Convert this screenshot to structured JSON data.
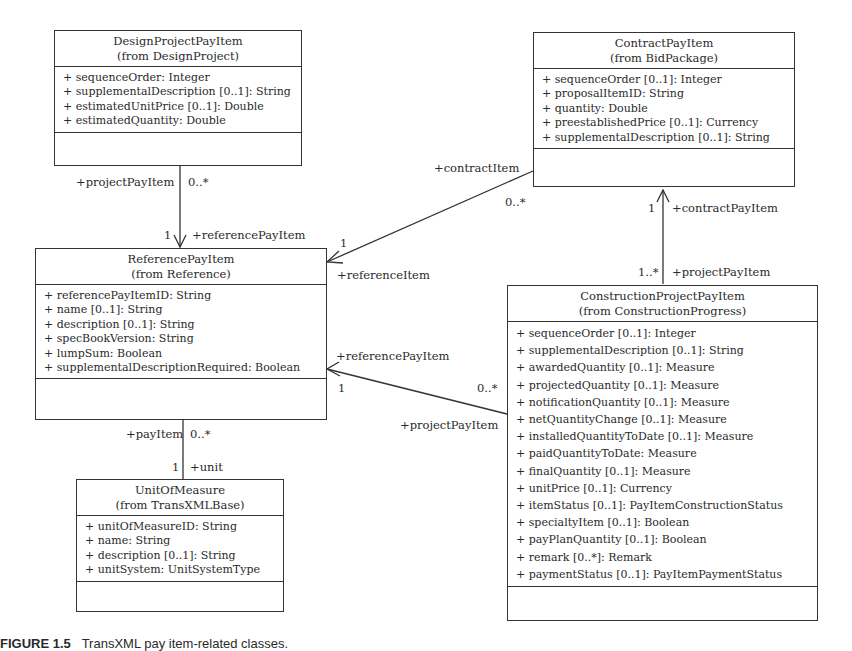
{
  "classes": {
    "design": {
      "name": "DesignProjectPayItem",
      "package": "(from DesignProject)",
      "attributes": [
        "+ sequenceOrder: Integer",
        "+ supplementalDescription [0..1]: String",
        "+ estimatedUnitPrice [0..1]: Double",
        "+ estimatedQuantity: Double"
      ]
    },
    "contract": {
      "name": "ContractPayItem",
      "package": "(from BidPackage)",
      "attributes": [
        "+ sequenceOrder [0..1]: Integer",
        "+ proposalItemID: String",
        "+ quantity: Double",
        "+ preestablishedPrice [0..1]: Currency",
        "+ supplementalDescription [0..1]: String"
      ]
    },
    "reference": {
      "name": "ReferencePayItem",
      "package": "(from Reference)",
      "attributes": [
        "+ referencePayItemID: String",
        "+ name [0..1]: String",
        "+ description [0..1]: String",
        "+ specBookVersion: String",
        "+ lumpSum: Boolean",
        "+ supplementalDescriptionRequired: Boolean"
      ]
    },
    "construction": {
      "name": "ConstructionProjectPayItem",
      "package": "(from ConstructionProgress)",
      "attributes": [
        "+ sequenceOrder [0..1]: Integer",
        "+ supplementalDescription [0..1]: String",
        "+ awardedQuantity [0..1]: Measure",
        "+ projectedQuantity [0..1]: Measure",
        "+ notificationQuantity [0..1]: Measure",
        "+ netQuantityChange [0..1]: Measure",
        "+ installedQuantityToDate [0..1]: Measure",
        "+ paidQuantityToDate: Measure",
        "+ finalQuantity [0..1]: Measure",
        "+ unitPrice [0..1]: Currency",
        "+ itemStatus [0..1]: PayItemConstructionStatus",
        "+ specialtyItem [0..1]: Boolean",
        "+ payPlanQuantity [0..1]: Boolean",
        "+ remark [0..*]: Remark",
        "+ paymentStatus [0..1]: PayItemPaymentStatus"
      ]
    },
    "unit": {
      "name": "UnitOfMeasure",
      "package": "(from TransXMLBase)",
      "attributes": [
        "+ unitOfMeasureID: String",
        "+ name: String",
        "+ description [0..1]: String",
        "+ unitSystem: UnitSystemType"
      ]
    }
  },
  "associations": {
    "design_ref": {
      "source_role": "+projectPayItem",
      "source_mult": "0..*",
      "target_mult": "1",
      "target_role": "+referencePayItem"
    },
    "contract_ref": {
      "source_role": "+contractItem",
      "source_mult": "0..*",
      "target_mult": "1",
      "target_role": "+referenceItem"
    },
    "construction_contract": {
      "target_mult": "1",
      "target_role": "+contractPayItem",
      "source_mult": "1..*",
      "source_role": "+projectPayItem"
    },
    "construction_ref": {
      "target_role": "+referencePayItem",
      "target_mult": "1",
      "source_mult": "0..*",
      "source_role": "+projectPayItem"
    },
    "ref_unit": {
      "source_role": "+payItem",
      "source_mult": "0..*",
      "target_mult": "1",
      "target_role": "+unit"
    }
  },
  "caption": {
    "label": "FIGURE 1.5",
    "text": "TransXML pay item-related classes."
  }
}
